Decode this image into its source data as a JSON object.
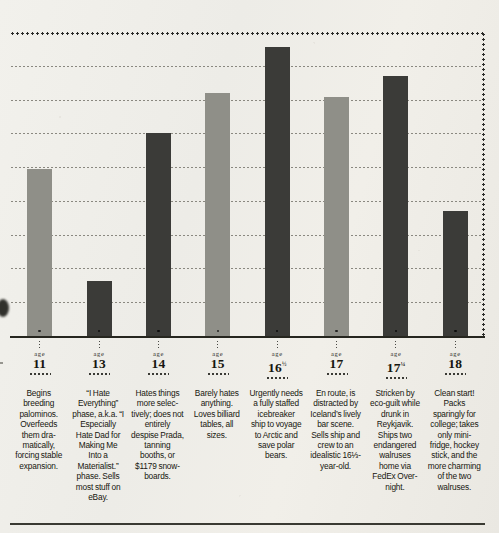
{
  "chart_data": {
    "type": "bar",
    "title": "",
    "subtitle": "",
    "xlabel": "age",
    "ylabel": "",
    "grid": true,
    "gridlines": 8,
    "legend": "none",
    "ylim": [
      0,
      8
    ],
    "categories": [
      "11",
      "13",
      "14",
      "15",
      "16½",
      "17",
      "17¼",
      "18"
    ],
    "values": [
      4.4,
      1.45,
      5.35,
      6.4,
      7.6,
      6.3,
      6.85,
      3.3
    ],
    "bar_colors": [
      "#8f8f88",
      "#3b3b38",
      "#3b3b38",
      "#8f8f88",
      "#3b3b38",
      "#8f8f88",
      "#3b3b38",
      "#3b3b38"
    ],
    "series": [
      {
        "name": "teen phase",
        "values": [
          4.4,
          1.45,
          5.35,
          6.4,
          7.6,
          6.3,
          6.85,
          3.3
        ]
      }
    ]
  },
  "axis": {
    "age_word": "age",
    "ticks": [
      {
        "number": "11",
        "fraction": ""
      },
      {
        "number": "13",
        "fraction": ""
      },
      {
        "number": "14",
        "fraction": ""
      },
      {
        "number": "15",
        "fraction": ""
      },
      {
        "number": "16",
        "fraction": "1/2"
      },
      {
        "number": "17",
        "fraction": ""
      },
      {
        "number": "17",
        "fraction": "1/4"
      },
      {
        "number": "18",
        "fraction": ""
      }
    ]
  },
  "captions": [
    "Begins breeding palominos. Overfeeds them dra­matically, forcing stable expansion.",
    "“I Hate Everything” phase, a.k.a. “I Especially Hate Dad for Making Me Into a Materialist.” phase. Sells most stuff on eBay.",
    "Hates things more selec­tively; does not entirely despise Prada, tan­ning booths, or $1179 snow­boards.",
    "Barely hates anything. Loves billiard tables, all sizes.",
    "Urgently needs a fully staffed icebreaker ship to voyage to Arctic and save polar bears.",
    "En route, is distracted by Iceland’s lively bar scene. Sells ship and crew to an idealistic 16⅓-year-old.",
    "Stricken by eco-guilt while drunk in Reykjavik. Ships two endangered walruses home via FedEx Over­night.",
    "Clean start! Packs sparingly for college; takes only mini-fridge, hockey stick, and the more charming of the two walruses."
  ],
  "colors": {
    "paper": "#efeeea",
    "ink": "#17170f",
    "bar_light": "#8f8f88",
    "bar_dark": "#3b3b38",
    "gridline": "#8a8880",
    "axis": "#26261f"
  }
}
